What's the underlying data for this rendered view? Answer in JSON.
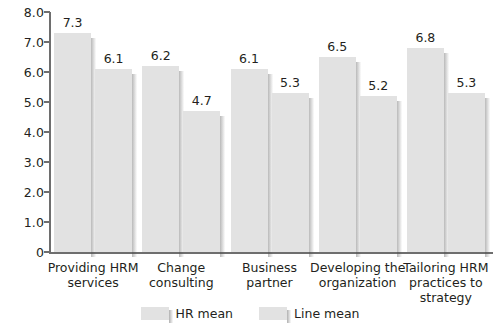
{
  "chart_data": {
    "type": "bar",
    "title": "",
    "subtitle": "",
    "xlabel": "",
    "ylabel": "",
    "ylim": [
      0,
      8
    ],
    "yticks": [
      "0",
      "1.0",
      "2.0",
      "3.0",
      "4.0",
      "5.0",
      "6.0",
      "7.0",
      "8.0"
    ],
    "ytick_values": [
      0,
      1,
      2,
      3,
      4,
      5,
      6,
      7,
      8
    ],
    "grid": false,
    "legend_position": "bottom",
    "categories": [
      "Providing HRM\nservices",
      "Change\nconsulting",
      "Business\npartner",
      "Developing the\norganization",
      "Tailoring HRM\npractices to\nstrategy"
    ],
    "series": [
      {
        "name": "HR mean",
        "values": [
          7.3,
          6.2,
          6.1,
          6.5,
          6.8
        ],
        "color": "#e2e2e2"
      },
      {
        "name": "Line mean",
        "values": [
          6.1,
          4.7,
          5.3,
          5.2,
          5.3
        ],
        "color": "#e2e2e2"
      }
    ],
    "value_labels": [
      "7.3",
      "6.1",
      "6.2",
      "4.7",
      "6.1",
      "5.3",
      "6.5",
      "5.2",
      "6.8",
      "5.3"
    ]
  },
  "legend": {
    "items": [
      {
        "label": "HR mean"
      },
      {
        "label": "Line mean"
      }
    ]
  },
  "colors": {
    "bar_fill": "#e2e2e2",
    "axis": "#6e6e6e",
    "text": "#231f20",
    "background": "#ffffff"
  }
}
